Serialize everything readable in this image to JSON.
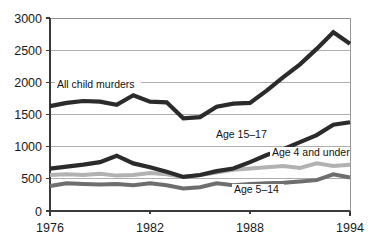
{
  "chart_data": {
    "type": "line",
    "title": "",
    "xlabel": "",
    "ylabel": "",
    "x": [
      1976,
      1977,
      1978,
      1979,
      1980,
      1981,
      1982,
      1983,
      1984,
      1985,
      1986,
      1987,
      1988,
      1989,
      1990,
      1991,
      1992,
      1993,
      1994
    ],
    "xlim": [
      1976,
      1994
    ],
    "ylim": [
      0,
      3000
    ],
    "xticks": [
      1976,
      1982,
      1988,
      1994
    ],
    "xtick_labels": [
      "1976",
      "1982",
      "1988",
      "1994"
    ],
    "yticks": [
      0,
      500,
      1000,
      1500,
      2000,
      2500,
      3000
    ],
    "ytick_labels": [
      "0",
      "500",
      "1000",
      "1500",
      "2000",
      "2500",
      "3000"
    ],
    "grid": true,
    "legend_position": "inline-annotations",
    "series": [
      {
        "name": "All child murders",
        "color": "#2b2b2b",
        "width": 4.2,
        "values": [
          1630,
          1680,
          1710,
          1700,
          1650,
          1800,
          1700,
          1690,
          1440,
          1460,
          1620,
          1670,
          1680,
          1870,
          2080,
          2280,
          2520,
          2780,
          2600
        ]
      },
      {
        "name": "Age 15-17",
        "color": "#2b2b2b",
        "width": 4.2,
        "values": [
          660,
          690,
          720,
          760,
          860,
          740,
          680,
          610,
          530,
          560,
          620,
          660,
          760,
          870,
          960,
          1070,
          1180,
          1340,
          1380
        ]
      },
      {
        "name": "Age 5-14",
        "color": "#6e6e6e",
        "width": 4.0,
        "values": [
          390,
          430,
          420,
          410,
          420,
          400,
          430,
          400,
          350,
          370,
          430,
          400,
          420,
          430,
          440,
          460,
          480,
          570,
          520
        ]
      },
      {
        "name": "Age 4 and under",
        "color": "#b2b2b2",
        "width": 4.0,
        "values": [
          560,
          570,
          560,
          580,
          550,
          560,
          590,
          570,
          530,
          560,
          600,
          640,
          660,
          680,
          700,
          670,
          740,
          700,
          720
        ]
      }
    ],
    "annotations": [
      {
        "text": "All child murders",
        "x": 57,
        "y": 88,
        "width": 86
      },
      {
        "text": "Age 15–17",
        "x": 216,
        "y": 138,
        "width": 54
      },
      {
        "text": "Age 4 and under",
        "x": 272,
        "y": 156,
        "width": 80
      },
      {
        "text": "Age 5–14",
        "x": 234,
        "y": 193,
        "width": 52
      }
    ]
  },
  "layout": {
    "plot_left": 50,
    "plot_right": 350,
    "plot_top": 18,
    "plot_bottom": 211
  }
}
